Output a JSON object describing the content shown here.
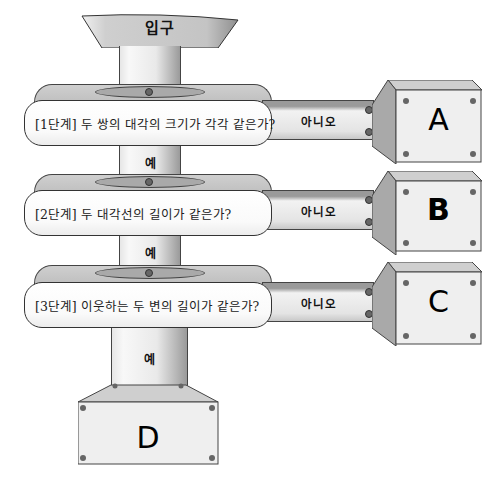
{
  "entrance": {
    "label": "입구"
  },
  "yes_label": "예",
  "no_label": "아니오",
  "stages": [
    {
      "question": "[1단계] 두 쌍의 대각의 크기가 각각 같은가?",
      "no_result": "A",
      "yes_label": "예",
      "no_label": "아니오"
    },
    {
      "question": "[2단계] 두 대각선의 길이가 같은가?",
      "no_result": "B",
      "yes_label": "예",
      "no_label": "아니오"
    },
    {
      "question": "[3단계] 이웃하는 두 변의 길이가 같은가?",
      "no_result": "C",
      "yes_label": "예",
      "no_label": "아니오"
    }
  ],
  "final_result": "D",
  "colors": {
    "metal_light": "#efefef",
    "metal_mid": "#bdbdbd",
    "metal_dark": "#9a9a9a",
    "outline": "#444444"
  }
}
